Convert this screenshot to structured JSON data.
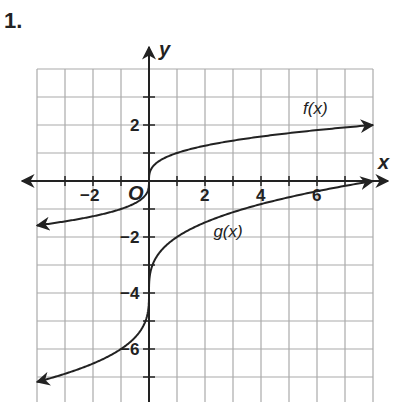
{
  "problem_number": "1.",
  "chart_data": {
    "type": "line",
    "title": "",
    "xlabel": "x",
    "ylabel": "y",
    "origin_label": "O",
    "xlim": [
      -4,
      8
    ],
    "ylim": [
      -8,
      4
    ],
    "grid": true,
    "x_ticks": [
      -2,
      2,
      4,
      6
    ],
    "x_tick_labels": [
      "−2",
      "2",
      "4",
      "6"
    ],
    "y_ticks": [
      2,
      -2,
      -4,
      -6
    ],
    "y_tick_labels": [
      "2",
      "−2",
      "−4",
      "−6"
    ],
    "series": [
      {
        "name": "f(x)",
        "x": [
          -4,
          -2,
          -1,
          0,
          1,
          2,
          4,
          6,
          8
        ],
        "values": [
          -1.59,
          -1.26,
          -1.0,
          0,
          1.0,
          1.26,
          1.59,
          1.82,
          2.0
        ]
      },
      {
        "name": "g(x)",
        "x": [
          -4,
          -2,
          -1,
          0,
          1,
          2,
          4,
          6,
          8
        ],
        "values": [
          -7.17,
          -6.52,
          -6.0,
          -4.0,
          -2.0,
          -1.48,
          -0.83,
          -0.37,
          0.0
        ]
      }
    ],
    "annotations": [
      {
        "text": "f(x)",
        "x": 5.5,
        "y": 2.6
      },
      {
        "text": "g(x)",
        "x": 2.3,
        "y": -1.8
      }
    ]
  }
}
